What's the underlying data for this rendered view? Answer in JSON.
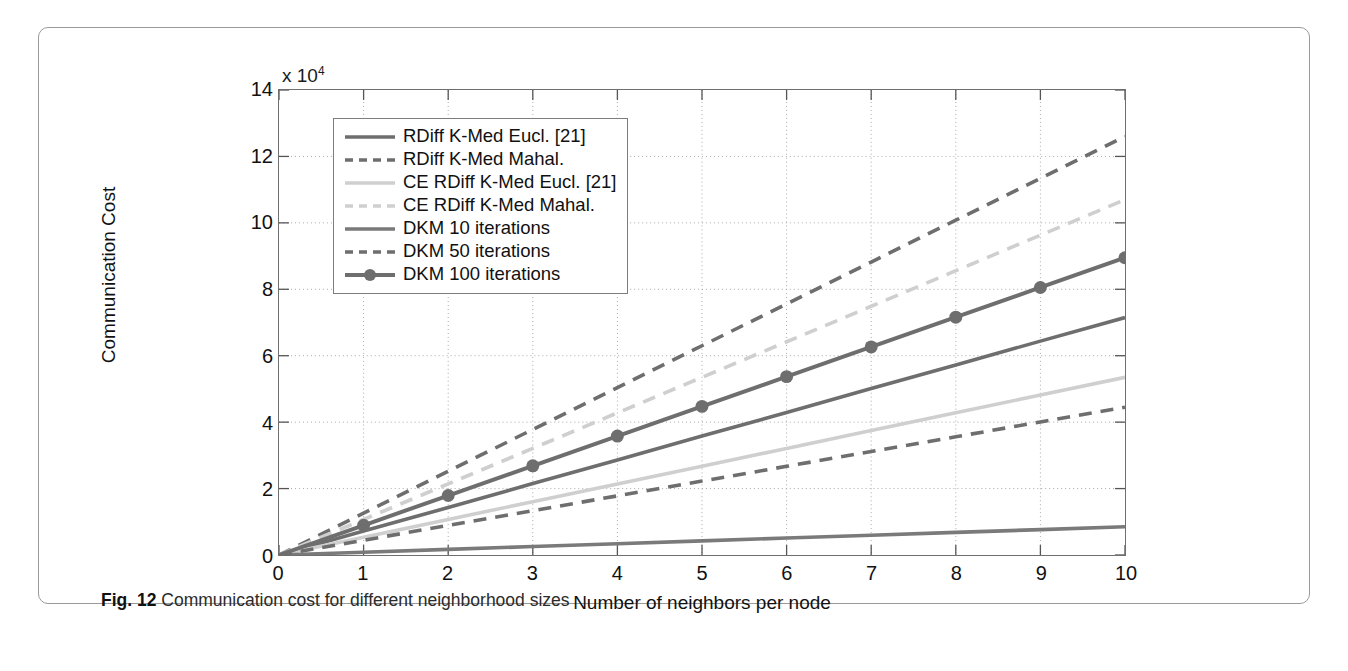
{
  "figure": {
    "caption_label": "Fig. 12",
    "caption_text": "Communication cost for different neighborhood sizes"
  },
  "chart_data": {
    "type": "line",
    "title": "",
    "xlabel": "Number of neighbors per node",
    "ylabel": "Communication Cost",
    "y_multiplier_text": "x 10",
    "y_multiplier_exponent": "4",
    "y_multiplier": 10000,
    "xlim": [
      0,
      10
    ],
    "ylim": [
      0,
      14
    ],
    "xticks": [
      0,
      1,
      2,
      3,
      4,
      5,
      6,
      7,
      8,
      9,
      10
    ],
    "yticks": [
      0,
      2,
      4,
      6,
      8,
      10,
      12,
      14
    ],
    "grid": "dotted",
    "legend_position": "top-left inside axes",
    "x": [
      0,
      1,
      2,
      3,
      4,
      5,
      6,
      7,
      8,
      9,
      10
    ],
    "series": [
      {
        "name": "RDiff K-Med Eucl. [21]",
        "style": "solid",
        "color": "#6e6e6e",
        "marker": "none",
        "values": [
          0,
          0.72,
          1.43,
          2.15,
          2.86,
          3.58,
          4.29,
          5.01,
          5.72,
          6.44,
          7.15
        ]
      },
      {
        "name": "RDiff K-Med Mahal.",
        "style": "dashed",
        "color": "#6e6e6e",
        "marker": "none",
        "values": [
          0,
          1.26,
          2.52,
          3.78,
          5.04,
          6.3,
          7.56,
          8.82,
          10.08,
          11.34,
          12.6
        ]
      },
      {
        "name": "CE RDiff K-Med Eucl. [21]",
        "style": "solid",
        "color": "#cfcfcf",
        "marker": "none",
        "values": [
          0,
          0.535,
          1.07,
          1.605,
          2.14,
          2.675,
          3.21,
          3.745,
          4.28,
          4.815,
          5.35
        ]
      },
      {
        "name": "CE RDiff K-Med Mahal.",
        "style": "dashed",
        "color": "#cfcfcf",
        "marker": "none",
        "values": [
          0,
          1.07,
          2.14,
          3.21,
          4.28,
          5.35,
          6.42,
          7.49,
          8.56,
          9.63,
          10.7
        ]
      },
      {
        "name": "DKM 10 iterations",
        "style": "solid",
        "color": "#7a7a7a",
        "marker": "none",
        "values": [
          0,
          0.085,
          0.17,
          0.255,
          0.34,
          0.425,
          0.51,
          0.595,
          0.68,
          0.765,
          0.85
        ]
      },
      {
        "name": "DKM 50 iterations",
        "style": "dashed",
        "color": "#6e6e6e",
        "marker": "none",
        "values": [
          0,
          0.445,
          0.89,
          1.335,
          1.78,
          2.225,
          2.67,
          3.115,
          3.56,
          4.005,
          4.45
        ]
      },
      {
        "name": "DKM 100 iterations",
        "style": "solid",
        "color": "#6e6e6e",
        "marker": "circle",
        "values": [
          0,
          0.895,
          1.79,
          2.685,
          3.58,
          4.475,
          5.37,
          6.265,
          7.16,
          8.055,
          8.95
        ]
      }
    ]
  }
}
